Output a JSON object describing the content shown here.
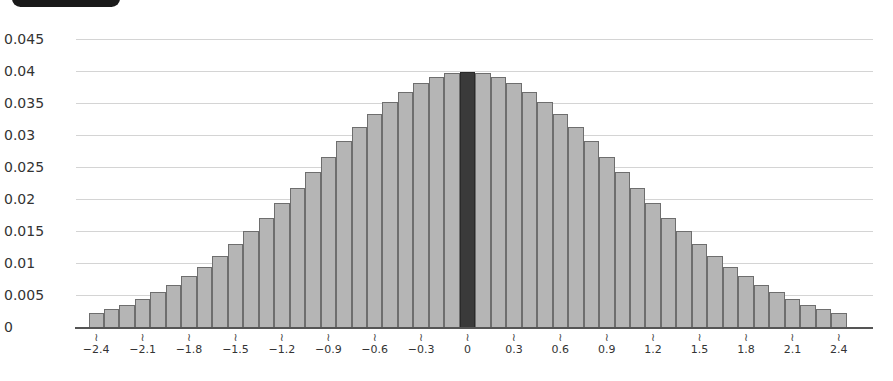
{
  "header": {
    "tab_color": "#1a1a1a"
  },
  "chart_data": {
    "type": "bar",
    "title": "",
    "xlabel": "",
    "ylabel": "",
    "ylim": [
      0,
      0.045
    ],
    "grid": true,
    "y_ticks": [
      "0.045",
      "0.04",
      "0.035",
      "0.03",
      "0.025",
      "0.02",
      "0.015",
      "0.01",
      "0.005",
      "0"
    ],
    "x_tick_labels": [
      "−2.4",
      "−2.1",
      "−1.8",
      "−1.5",
      "−1.2",
      "−0.9",
      "−0.6",
      "−0.3",
      "0",
      "0.3",
      "0.6",
      "0.9",
      "1.2",
      "1.5",
      "1.8",
      "2.1",
      "2.4"
    ],
    "x_tick_values": [
      -2.4,
      -2.1,
      -1.8,
      -1.5,
      -1.2,
      -0.9,
      -0.6,
      -0.3,
      0,
      0.3,
      0.6,
      0.9,
      1.2,
      1.5,
      1.8,
      2.1,
      2.4
    ],
    "axis_break_marker": "≀",
    "highlighted_category": 0,
    "bar_color": "#b5b5b5",
    "highlight_color": "#3a3a3a",
    "categories": [
      -2.4,
      -2.3,
      -2.2,
      -2.1,
      -2.0,
      -1.9,
      -1.8,
      -1.7,
      -1.6,
      -1.5,
      -1.4,
      -1.3,
      -1.2,
      -1.1,
      -1.0,
      -0.9,
      -0.8,
      -0.7,
      -0.6,
      -0.5,
      -0.4,
      -0.3,
      -0.2,
      -0.1,
      0,
      0.1,
      0.2,
      0.3,
      0.4,
      0.5,
      0.6,
      0.7,
      0.8,
      0.9,
      1.0,
      1.1,
      1.2,
      1.3,
      1.4,
      1.5,
      1.6,
      1.7,
      1.8,
      1.9,
      2.0,
      2.1,
      2.2,
      2.3,
      2.4
    ],
    "values": [
      0.0022,
      0.0028,
      0.0035,
      0.0044,
      0.0054,
      0.0066,
      0.0079,
      0.0094,
      0.0111,
      0.013,
      0.015,
      0.0171,
      0.0194,
      0.0218,
      0.0242,
      0.0266,
      0.029,
      0.0312,
      0.0333,
      0.0352,
      0.0368,
      0.0381,
      0.0391,
      0.0397,
      0.0399,
      0.0397,
      0.0391,
      0.0381,
      0.0368,
      0.0352,
      0.0333,
      0.0312,
      0.029,
      0.0266,
      0.0242,
      0.0218,
      0.0194,
      0.0171,
      0.015,
      0.013,
      0.0111,
      0.0094,
      0.0079,
      0.0066,
      0.0054,
      0.0044,
      0.0035,
      0.0028,
      0.0022
    ]
  }
}
